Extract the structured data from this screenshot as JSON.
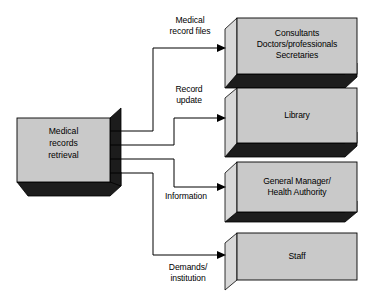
{
  "diagram": {
    "colors": {
      "face": "#c9c9c9",
      "bevel": "#d8d8d8",
      "shadow": "#1c1c1c",
      "outline": "#000000",
      "line": "#000000",
      "background": "#ffffff",
      "text": "#000000"
    },
    "source": {
      "id": "medical-records-retrieval",
      "label": "Medical\nrecords\nretrieval"
    },
    "targets": [
      {
        "id": "consultants",
        "label": "Consultants\nDoctors/professionals\nSecretaries"
      },
      {
        "id": "library",
        "label": "Library"
      },
      {
        "id": "general-manager",
        "label": "General Manager/\nHealth Authority"
      },
      {
        "id": "staff",
        "label": "Staff"
      }
    ],
    "flows": [
      {
        "id": "medical-record-files",
        "from": "medical-records-retrieval",
        "to": "consultants",
        "label": "Medical\nrecord files"
      },
      {
        "id": "record-update",
        "from": "medical-records-retrieval",
        "to": "library",
        "label": "Record\nupdate"
      },
      {
        "id": "information",
        "from": "medical-records-retrieval",
        "to": "general-manager",
        "label": "Information"
      },
      {
        "id": "demands-institution",
        "from": "medical-records-retrieval",
        "to": "staff",
        "label": "Demands/\ninstitution"
      }
    ]
  }
}
